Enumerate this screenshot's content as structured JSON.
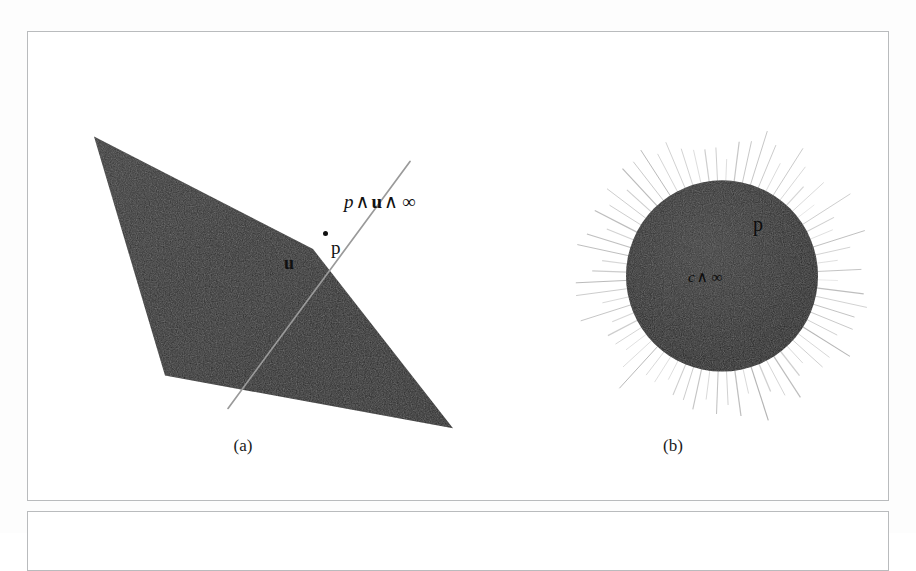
{
  "figure": {
    "type": "geometric-algebra-illustration",
    "background_color": "#ffffff",
    "frame_border_color": "#b9bbbd",
    "fill_color": "#2b2b2b",
    "line_color": "#9b9b9b"
  },
  "panels": [
    {
      "id": "a",
      "caption": "(a)",
      "subject": "plane-with-line-through-point",
      "labels": {
        "line_label": {
          "p": "p",
          "wedge1": "∧",
          "u": "u",
          "wedge2": "∧",
          "inf": "∞"
        },
        "point_label": "p",
        "normal_label": "u"
      },
      "geometry": {
        "quad_points": "66,105 285,218 425,398 137,345",
        "line_start_x": 382,
        "line_start_y": 130,
        "line_end_x": 200,
        "line_end_y": 378,
        "point_x": 297,
        "point_y": 201
      }
    },
    {
      "id": "b",
      "caption": "(b)",
      "subject": "sphere-with-radiating-rays",
      "labels": {
        "point_label": "p",
        "center_label": {
          "c": "c",
          "wedge": "∧",
          "inf": "∞"
        }
      },
      "geometry": {
        "center_x": 694,
        "center_y": 245,
        "radius": 96,
        "ray_count": 72,
        "ray_outer_radius": 152
      }
    }
  ]
}
